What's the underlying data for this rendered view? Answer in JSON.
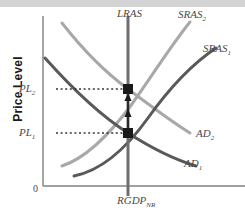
{
  "figure": {
    "axes": {
      "y_axis_label": "Price Level",
      "x_axis_label_main": "RGDP",
      "x_axis_label_sub": "NR",
      "origin_label": "0"
    },
    "tick_labels": [
      {
        "name": "pl2",
        "main": "PL",
        "sub": "2",
        "y": 89
      },
      {
        "name": "pl1",
        "main": "PL",
        "sub": "1",
        "y": 133
      }
    ],
    "curve_labels": [
      {
        "name": "lras",
        "main": "LRAS",
        "sub": "",
        "x": 117,
        "y": 8
      },
      {
        "name": "sras2",
        "main": "SRAS",
        "sub": "2",
        "x": 178,
        "y": 9
      },
      {
        "name": "sras1",
        "main": "SRAS",
        "sub": "1",
        "x": 203,
        "y": 43
      },
      {
        "name": "ad2",
        "main": "AD",
        "sub": "2",
        "x": 196,
        "y": 128
      },
      {
        "name": "ad1",
        "main": "AD",
        "sub": "1",
        "x": 184,
        "y": 158
      }
    ],
    "colors": {
      "axis": "#808080",
      "dark_curve": "#595959",
      "light_curve": "#a8a8a8",
      "lras": "#6e6e6e",
      "dotted_line": "#333333",
      "equilibrium_point": "#1a1a1a",
      "arrow": "#1a1a1a",
      "top_band": "#d3d3d3",
      "label_text": "#4a4a4a",
      "axis_title_text": "#1a1a1a"
    }
  },
  "chart_data": {
    "type": "line",
    "title": "",
    "xlabel": "RGDP_NR",
    "ylabel": "Price Level",
    "grid": false,
    "legend": "inline-curve-labels",
    "xlim": [
      43,
      245
    ],
    "ylim": [
      186,
      7
    ],
    "annotations": [
      {
        "name": "shift-arrow-lower",
        "type": "arrow",
        "direction": "up",
        "x": 128,
        "y_from": 128,
        "y_to": 112
      },
      {
        "name": "shift-arrow-upper",
        "type": "arrow",
        "direction": "up",
        "x": 128,
        "y_from": 110,
        "y_to": 94
      }
    ],
    "equilibria": [
      {
        "name": "equilibrium-2",
        "label": "PL2",
        "x": 128,
        "y": 89
      },
      {
        "name": "equilibrium-1",
        "label": "PL1",
        "x": 128,
        "y": 133
      }
    ],
    "series": [
      {
        "name": "LRAS",
        "kind": "vertical-line",
        "color": "#6e6e6e",
        "width": 3,
        "path": "M 128 16 L 128 196"
      },
      {
        "name": "SRAS1",
        "kind": "curve",
        "color": "#595959",
        "width": 3,
        "path": "M 74 174 C 100 168, 122 144, 140 116 C 158 88, 182 62, 212 48"
      },
      {
        "name": "SRAS2",
        "kind": "curve",
        "color": "#a8a8a8",
        "width": 3,
        "path": "M 62 23 C 78 52, 96 82, 118 106 C 140 130, 164 140, 186 144"
      },
      {
        "name": "AD1",
        "kind": "curve",
        "color": "#595959",
        "width": 3,
        "path": "M 45 58 C 68 84, 96 112, 128 133 C 158 152, 178 160, 192 164"
      },
      {
        "name": "AD2",
        "kind": "curve",
        "color": "#a8a8a8",
        "width": 3,
        "path": "M 62 23 C 80 46, 102 70, 128 89 C 152 107, 172 122, 190 133"
      }
    ],
    "dotted_lines": [
      {
        "name": "dotted-pl2",
        "from_x": 56,
        "to_x": 128,
        "y": 89
      },
      {
        "name": "dotted-pl1",
        "from_x": 56,
        "to_x": 128,
        "y": 133
      }
    ]
  }
}
